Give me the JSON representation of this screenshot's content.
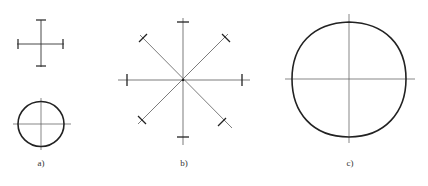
{
  "figure": {
    "panels": [
      {
        "id": "a",
        "label": "a)",
        "description": "cross with end ticks and small circle with axes"
      },
      {
        "id": "b",
        "label": "b)",
        "description": "eight-ray star with end ticks"
      },
      {
        "id": "c",
        "label": "c)",
        "description": "large circle with axes"
      }
    ],
    "colors": {
      "line": "#222222",
      "thin": "#555555",
      "background": "#ffffff"
    }
  }
}
